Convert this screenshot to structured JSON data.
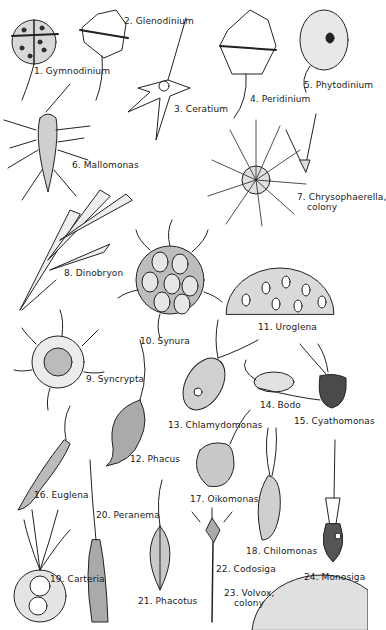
{
  "figure": {
    "organisms": [
      {
        "num": "1",
        "name": "Gymnodinium",
        "label": "1. Gymnodinium",
        "x": 34,
        "y": 70
      },
      {
        "num": "2",
        "name": "Glenodinium",
        "label": "2. Glenodinium",
        "x": 124,
        "y": 16
      },
      {
        "num": "3",
        "name": "Ceratium",
        "label": "3. Ceratium",
        "x": 174,
        "y": 104
      },
      {
        "num": "4",
        "name": "Peridinium",
        "label": "4. Peridinium",
        "x": 250,
        "y": 94
      },
      {
        "num": "5",
        "name": "Phytodinium",
        "label": "5. Phytodinium",
        "x": 304,
        "y": 78
      },
      {
        "num": "6",
        "name": "Mallomonas",
        "label": "6. Mallomonas",
        "x": 72,
        "y": 157
      },
      {
        "num": "7",
        "name": "Chrysophaerella, colony",
        "label": "7. Chrysophaerella,",
        "label_line2": "colony",
        "x": 298,
        "y": 190
      },
      {
        "num": "8",
        "name": "Dinobryon",
        "label": "8. Dinobryon",
        "x": 64,
        "y": 269
      },
      {
        "num": "9",
        "name": "Syncrypta",
        "label": "9. Syncrypta",
        "x": 86,
        "y": 374
      },
      {
        "num": "10",
        "name": "Synura",
        "label": "10. Synura",
        "x": 140,
        "y": 336
      },
      {
        "num": "11",
        "name": "Uroglena",
        "label": "11. Uroglena",
        "x": 258,
        "y": 322
      },
      {
        "num": "12",
        "name": "Phacus",
        "label": "12. Phacus",
        "x": 130,
        "y": 454
      },
      {
        "num": "13",
        "name": "Chlamydomonas",
        "label": "13. Chlamydomonas",
        "x": 168,
        "y": 418
      },
      {
        "num": "14",
        "name": "Bodo",
        "label": "14. Bodo",
        "x": 260,
        "y": 400
      },
      {
        "num": "15",
        "name": "Cyathomonas",
        "label": "15. Cyathomonas",
        "x": 294,
        "y": 416
      },
      {
        "num": "16",
        "name": "Euglena",
        "label": "16. Euglena",
        "x": 34,
        "y": 490
      },
      {
        "num": "17",
        "name": "Oikomonas",
        "label": "17. Oikomonas",
        "x": 190,
        "y": 496
      },
      {
        "num": "18",
        "name": "Chilomonas",
        "label": "18. Chilomonas",
        "x": 246,
        "y": 548
      },
      {
        "num": "19",
        "name": "Carteria",
        "label": "19. Carteria",
        "x": 50,
        "y": 575
      },
      {
        "num": "20",
        "name": "Peranema",
        "label": "20. Peranema",
        "x": 96,
        "y": 510
      },
      {
        "num": "21",
        "name": "Phacotus",
        "label": "21. Phacotus",
        "x": 138,
        "y": 595
      },
      {
        "num": "22",
        "name": "Codosiga",
        "label": "22. Codosiga",
        "x": 216,
        "y": 564
      },
      {
        "num": "23",
        "name": "Volvox, colony",
        "label": "23. Volvox,",
        "label_line2": "colony",
        "x": 224,
        "y": 588
      },
      {
        "num": "24",
        "name": "Monosiga",
        "label": "24. Monosiga",
        "x": 304,
        "y": 572
      }
    ]
  }
}
